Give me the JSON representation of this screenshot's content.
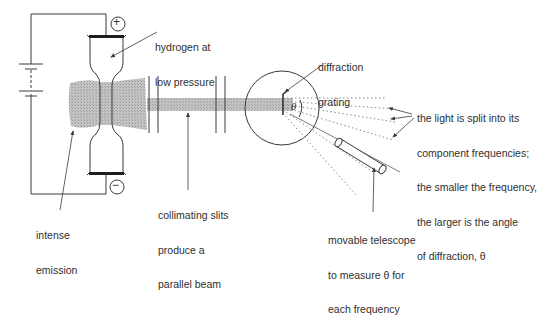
{
  "diagram": {
    "colors": {
      "line": "#3a3a3a",
      "beam": "#b8b8b8",
      "emission": "#b0b0b0",
      "electrode": "#1e1e1e",
      "dotted": "#8a8a8a"
    },
    "symbols": {
      "positive_terminal": "+",
      "negative_terminal": "−",
      "angle": "θ"
    },
    "labels": {
      "hydrogen": [
        "hydrogen at",
        "low pressure"
      ],
      "emission": [
        "intense",
        "emission"
      ],
      "slits": [
        "collimating slits",
        "produce a",
        "parallel beam"
      ],
      "grating": [
        "diffraction",
        "grating"
      ],
      "split": [
        "the light is split into its",
        "component frequencies;",
        "the smaller the frequency,",
        "the larger is the angle",
        "of diffraction, θ"
      ],
      "telescope": [
        "movable telescope",
        "to measure θ for",
        "each frequency"
      ]
    }
  }
}
